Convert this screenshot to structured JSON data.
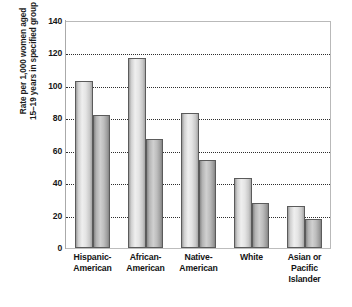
{
  "chart_data": {
    "type": "bar",
    "title": "",
    "subtitle": "",
    "xlabel": "",
    "ylabel": "Rate per 1,000 women aged 15–19 years in specified group",
    "ylabel_lines": [
      "Rate per 1,000 women aged",
      "15–19 years in specified group"
    ],
    "ylim": [
      0,
      140
    ],
    "ytick_labels": [
      "0",
      "20",
      "40",
      "60",
      "80",
      "100",
      "120",
      "140"
    ],
    "ytick_values": [
      0,
      20,
      40,
      60,
      80,
      100,
      120,
      140
    ],
    "grid": true,
    "grid_axis": "y",
    "legend": false,
    "legend_position": "none",
    "categories": [
      "Hispanic-American",
      "African-American",
      "Native-American",
      "White",
      "Asian or Pacific Islander"
    ],
    "category_label_lines": [
      [
        "Hispanic-",
        "American"
      ],
      [
        "African-",
        "American"
      ],
      [
        "Native-",
        "American"
      ],
      [
        "White"
      ],
      [
        "Asian or",
        "Pacific",
        "Islander"
      ]
    ],
    "series": [
      {
        "name": "series-1",
        "values": [
          103,
          117,
          83,
          43,
          26
        ]
      },
      {
        "name": "series-2",
        "values": [
          82,
          67,
          54,
          28,
          18
        ]
      }
    ]
  },
  "colors": {
    "plot_background": "#ffffff",
    "gridline": "#2e2e2e",
    "axis": "#aaaaaa",
    "bar_series_1": "#e4e4e4",
    "bar_series_2": "#bdbdbd",
    "bar_outline": "#5b5b5b",
    "text": "#141414"
  }
}
